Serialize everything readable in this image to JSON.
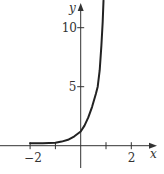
{
  "chart_data": {
    "type": "line",
    "title": "",
    "xlabel": "x",
    "ylabel": "y",
    "x_ticks": [
      -2,
      -1,
      0,
      1,
      2
    ],
    "x_tick_labels": [
      "−2",
      "",
      "",
      "",
      "2"
    ],
    "y_ticks": [
      5,
      10
    ],
    "y_tick_labels": [
      "5",
      "10"
    ],
    "xlim": [
      -3.15,
      2.95
    ],
    "ylim": [
      -1.9,
      12.3
    ],
    "grid": false,
    "legend": null,
    "series": [
      {
        "name": "curve",
        "color": "#222222",
        "x": [
          -2,
          -1.5,
          -1,
          -0.75,
          -0.5,
          -0.25,
          0,
          0.15,
          0.3,
          0.45,
          0.6,
          0.67,
          0.75,
          0.82,
          0.87,
          0.9
        ],
        "y": [
          0.2,
          0.2,
          0.25,
          0.35,
          0.5,
          0.8,
          1.2,
          1.7,
          2.4,
          3.3,
          4.4,
          5.0,
          6.4,
          8.5,
          10.5,
          12.3
        ]
      }
    ]
  },
  "layout": {
    "origin_px": [
      80.7,
      145.7
    ],
    "px_per_x": 25.3,
    "px_per_y": 11.8
  }
}
